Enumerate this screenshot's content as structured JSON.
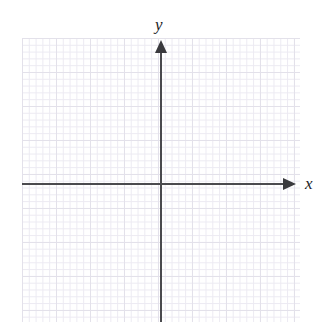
{
  "figure": {
    "type": "coordinate-plane",
    "width": 327,
    "height": 328,
    "background_color": "#ffffff"
  },
  "grid": {
    "left": 22,
    "top": 38,
    "right": 300,
    "bottom": 322,
    "major_spacing_px": 34,
    "minor_spacing_px": 6.8,
    "minor_color": "#eceaf2",
    "major_color": "#e3e1ea",
    "visible": true
  },
  "axes": {
    "origin": {
      "x": 161,
      "y": 184
    },
    "x_axis": {
      "label": "x",
      "label_x": 305,
      "label_y": 175,
      "start_x": 22,
      "end_x": 296,
      "y": 183,
      "color": "#4a4a4e",
      "arrow": "right",
      "arrow_tip_x": 296
    },
    "y_axis": {
      "label": "y",
      "label_x": 155,
      "label_y": 16,
      "start_y": 40,
      "end_y": 322,
      "x": 160,
      "color": "#4a4a4e",
      "arrow": "up",
      "arrow_tip_y": 40
    }
  },
  "chart_data": {
    "type": "scatter",
    "title": "",
    "xlabel": "x",
    "ylabel": "y",
    "series": [
      {
        "name": "",
        "x": [],
        "y": []
      }
    ],
    "xlim": [
      -10,
      10
    ],
    "ylim": [
      -10,
      10
    ],
    "grid": true,
    "legend": null,
    "annotations": [],
    "tick_labels": {
      "x": [],
      "y": []
    },
    "note": "Empty coordinate plane: no plotted data points, curves, or numeric tick labels are rendered."
  }
}
